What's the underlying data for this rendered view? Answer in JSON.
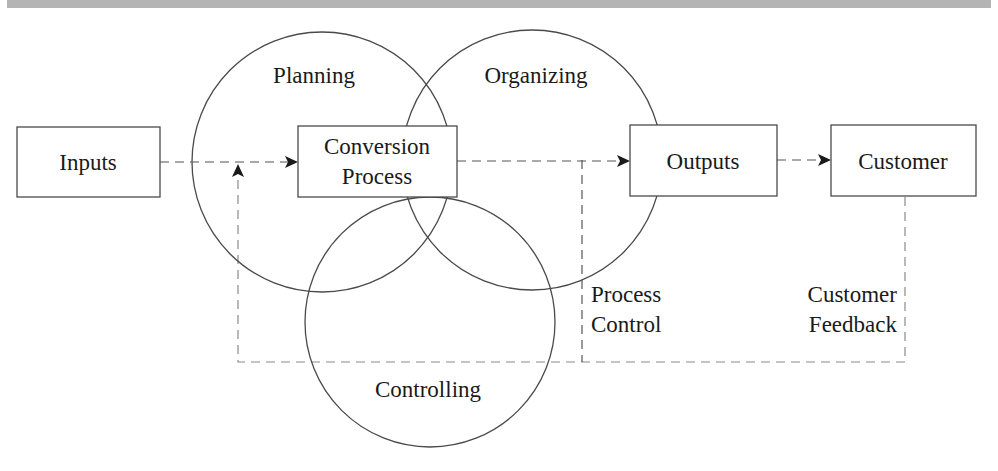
{
  "diagram": {
    "title_band_color": "#b4b4b4",
    "circles": [
      {
        "id": "planning",
        "label": "Planning"
      },
      {
        "id": "organizing",
        "label": "Organizing"
      },
      {
        "id": "controlling",
        "label": "Controlling"
      }
    ],
    "boxes": {
      "inputs": "Inputs",
      "conversion_line1": "Conversion",
      "conversion_line2": "Process",
      "outputs": "Outputs",
      "customer": "Customer"
    },
    "feedback_labels": {
      "process_control_line1": "Process",
      "process_control_line2": "Control",
      "customer_feedback_line1": "Customer",
      "customer_feedback_line2": "Feedback"
    }
  }
}
